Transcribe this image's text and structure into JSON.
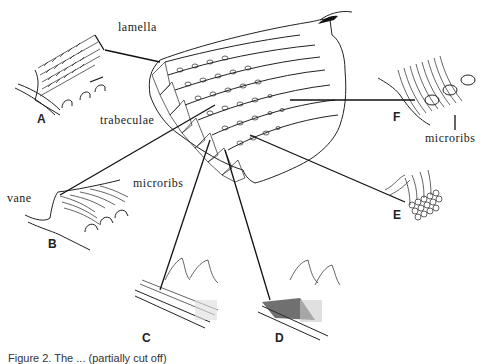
{
  "figure": {
    "labels": {
      "lamella": "lamella",
      "trabeculae": "trabeculae",
      "microribs_b": "microribs",
      "microribs_f": "microribs",
      "vane": "vane"
    },
    "panels": {
      "a": "A",
      "b": "B",
      "c": "C",
      "d": "D",
      "e": "E",
      "f": "F"
    },
    "caption": "Figure 2.  The ... (partially cut off)"
  }
}
